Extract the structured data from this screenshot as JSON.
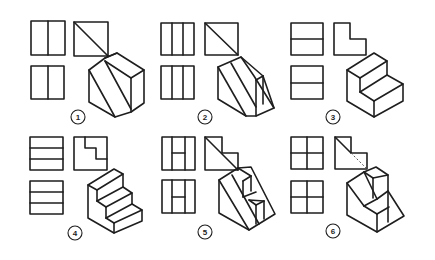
{
  "figure": {
    "line_color": "#1e1e1e",
    "background": "#ffffff"
  },
  "panels": [
    {
      "number": "1",
      "label_pos": [
        78,
        117
      ],
      "front_view": {
        "type": "rect-vsplit",
        "x": 31,
        "y": 21,
        "w": 34,
        "h": 34,
        "splits": [
          0.5
        ]
      },
      "side_view": {
        "type": "rect-vsplit",
        "x": 31,
        "y": 66,
        "w": 33,
        "h": 33,
        "splits": [
          0.5
        ]
      },
      "top_view": {
        "type": "rect-diag",
        "x": 74,
        "y": 22,
        "w": 34,
        "h": 34
      },
      "iso_description": "Hexagonal prism-like block with two parallel diagonal faces"
    },
    {
      "number": "2",
      "label_pos": [
        205,
        117
      ],
      "front_view": {
        "type": "rect-vsplit",
        "x": 161,
        "y": 23,
        "w": 33,
        "h": 32,
        "splits": [
          0.33,
          0.66
        ]
      },
      "side_view": {
        "type": "rect-vsplit",
        "x": 161,
        "y": 66,
        "w": 33,
        "h": 33,
        "splits": [
          0.33,
          0.66
        ]
      },
      "top_view": {
        "type": "rect-diag",
        "x": 205,
        "y": 23,
        "w": 33,
        "h": 32
      },
      "iso_description": "Wedge block with sloped face and vertical slots"
    },
    {
      "number": "3",
      "label_pos": [
        333,
        117
      ],
      "front_view": {
        "type": "rect-hsplit",
        "x": 291,
        "y": 23,
        "w": 32,
        "h": 32,
        "splits": [
          0.5
        ]
      },
      "side_view": {
        "type": "rect-hsplit",
        "x": 291,
        "y": 66,
        "w": 32,
        "h": 33,
        "splits": [
          0.5
        ]
      },
      "top_view": {
        "type": "l-shape",
        "x": 334,
        "y": 23,
        "w": 32,
        "h": 32
      },
      "iso_description": "Two-step block"
    },
    {
      "number": "4",
      "label_pos": [
        75,
        233
      ],
      "front_view": {
        "type": "rect-hsplit",
        "x": 30,
        "y": 137,
        "w": 33,
        "h": 33,
        "splits": [
          0.33,
          0.66
        ]
      },
      "side_view": {
        "type": "rect-hsplit",
        "x": 30,
        "y": 181,
        "w": 33,
        "h": 33,
        "splits": [
          0.33,
          0.66
        ]
      },
      "top_view": {
        "type": "stair-top",
        "x": 74,
        "y": 137,
        "w": 33,
        "h": 33
      },
      "iso_description": "Three-step staircase block"
    },
    {
      "number": "5",
      "label_pos": [
        205,
        232
      ],
      "front_view": {
        "type": "rect-h",
        "x": 162,
        "y": 137,
        "w": 33,
        "h": 33
      },
      "side_view": {
        "type": "rect-h",
        "x": 162,
        "y": 180,
        "w": 33,
        "h": 33
      },
      "top_view": {
        "type": "l-diag",
        "x": 205,
        "y": 137,
        "w": 33,
        "h": 33
      },
      "iso_description": "Wedge with stepped cubes on sloped face"
    },
    {
      "number": "6",
      "label_pos": [
        333,
        231
      ],
      "front_view": {
        "type": "rect-grid",
        "x": 291,
        "y": 137,
        "w": 32,
        "h": 32
      },
      "side_view": {
        "type": "rect-grid",
        "x": 291,
        "y": 181,
        "w": 32,
        "h": 32
      },
      "top_view": {
        "type": "l-diag-dash",
        "x": 335,
        "y": 137,
        "w": 32,
        "h": 32
      },
      "iso_description": "Sloped block with protruding cube steps"
    }
  ]
}
